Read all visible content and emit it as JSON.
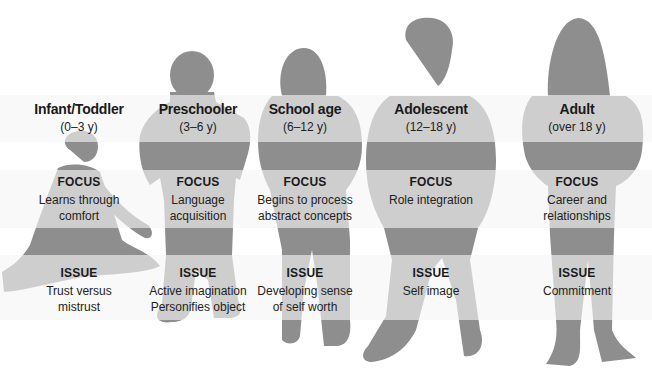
{
  "figure": {
    "colors": {
      "silhouette": "#8c8c8c",
      "band_overlay": "#f3f3f3",
      "text": "#1a1a1a"
    },
    "section_labels": {
      "focus": "FOCUS",
      "issue": "ISSUE"
    },
    "stages": [
      {
        "name": "Infant/Toddler",
        "age": "(0–3 y)",
        "focus": [
          "Learns through",
          "comfort"
        ],
        "issue": [
          "Trust versus",
          "mistrust"
        ]
      },
      {
        "name": "Preschooler",
        "age": "(3–6 y)",
        "focus": [
          "Language",
          "acquisition"
        ],
        "issue": [
          "Active imagination",
          "Personifies object"
        ]
      },
      {
        "name": "School age",
        "age": "(6–12 y)",
        "focus": [
          "Begins to process",
          "abstract concepts"
        ],
        "issue": [
          "Developing sense",
          "of self worth"
        ]
      },
      {
        "name": "Adolescent",
        "age": "(12–18 y)",
        "focus": [
          "Role integration"
        ],
        "issue": [
          "Self image"
        ]
      },
      {
        "name": "Adult",
        "age": "(over 18 y)",
        "focus": [
          "Career and",
          "relationships"
        ],
        "issue": [
          "Commitment"
        ]
      }
    ]
  }
}
